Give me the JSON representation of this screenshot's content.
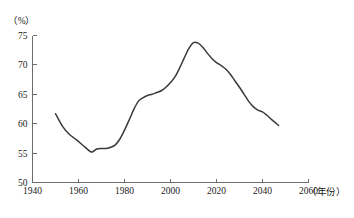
{
  "chart_data": {
    "type": "line",
    "title": "",
    "subtitle": "",
    "xlabel": "（年份）",
    "ylabel": "（%）",
    "xlim": [
      1940,
      2060
    ],
    "ylim": [
      50,
      75
    ],
    "xticks": [
      1940,
      1960,
      1980,
      2000,
      2020,
      2040,
      2060
    ],
    "xticklabels": [
      "1940",
      "1960",
      "1980",
      "2000",
      "2020",
      "2040",
      "2060"
    ],
    "yticks": [
      50,
      55,
      60,
      65,
      70,
      75
    ],
    "yticklabels": [
      "50",
      "55",
      "60",
      "65",
      "70",
      "75"
    ],
    "grid": false,
    "legend": "none",
    "line_color": "#3a3a3a",
    "axis_color": "#6e6e6e",
    "series": [
      {
        "name": "劳动年龄人口比重",
        "x": [
          1950,
          1953,
          1956,
          1959,
          1962,
          1965,
          1966,
          1968,
          1970,
          1972,
          1974,
          1976,
          1978,
          1980,
          1982,
          1984,
          1986,
          1988,
          1990,
          1992,
          1994,
          1996,
          1998,
          2000,
          2002,
          2004,
          2006,
          2008,
          2010,
          2012,
          2014,
          2016,
          2018,
          2020,
          2022,
          2024,
          2026,
          2028,
          2030,
          2032,
          2034,
          2036,
          2038,
          2040,
          2042,
          2044,
          2047
        ],
        "values": [
          61.7,
          59.6,
          58.2,
          57.3,
          56.3,
          55.3,
          55.2,
          55.7,
          55.8,
          55.8,
          56.0,
          56.4,
          57.4,
          58.9,
          60.6,
          62.4,
          63.8,
          64.4,
          64.8,
          65.0,
          65.3,
          65.6,
          66.2,
          67.0,
          68.0,
          69.5,
          71.2,
          72.8,
          73.8,
          73.7,
          73.0,
          72.0,
          71.1,
          70.4,
          69.9,
          69.3,
          68.4,
          67.3,
          66.2,
          65.0,
          63.8,
          62.9,
          62.3,
          62.0,
          61.4,
          60.7,
          59.7
        ]
      }
    ]
  },
  "axis": {
    "y_unit_label": "（%）",
    "x_title_label": "（年份）"
  }
}
